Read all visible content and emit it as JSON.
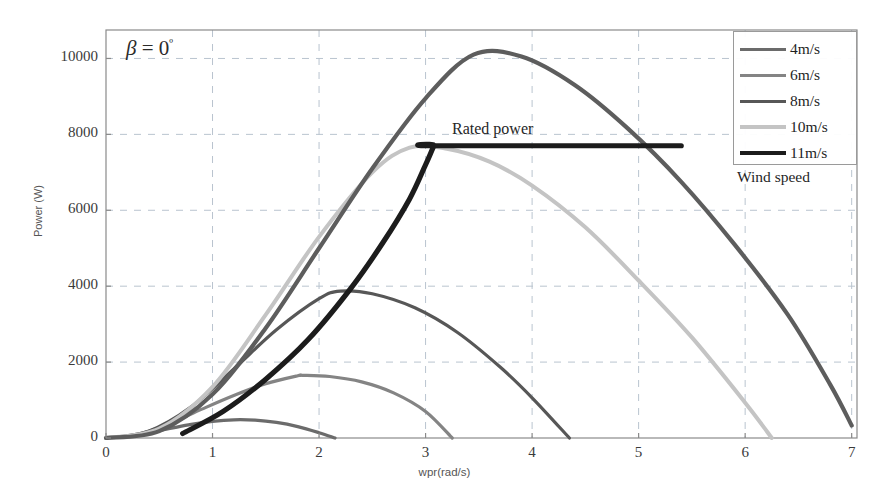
{
  "chart_data": {
    "type": "line",
    "title": "",
    "xlabel": "wpr(rad/s)",
    "ylabel": "Power (W)",
    "xlim": [
      0,
      7.05
    ],
    "ylim": [
      0,
      10750
    ],
    "xticks": [
      "0",
      "1",
      "2",
      "3",
      "4",
      "5",
      "6",
      "7"
    ],
    "xtick_values": [
      0,
      1,
      2,
      3,
      4,
      5,
      6,
      7
    ],
    "yticks": [
      "0",
      "2000",
      "4000",
      "6000",
      "8000",
      "10000"
    ],
    "ytick_values": [
      0,
      2000,
      4000,
      6000,
      8000,
      10000
    ],
    "grid": true,
    "grid_style": "dashed",
    "legend_position": "top-right",
    "legend_title": "Wind speed",
    "annotations": [
      {
        "name": "beta-annotation",
        "text_plain": "β = 0º",
        "beta": "β",
        "equals": " = 0",
        "degree": "º",
        "x": 0.2,
        "y": 10000
      },
      {
        "name": "rated-power-annotation",
        "text": "Rated power",
        "x": 3.3,
        "y": 8300
      }
    ],
    "series": [
      {
        "name": "4m/s",
        "label": "4m/s",
        "color": "#6b6b6b",
        "width": 3.2,
        "peak_x": 1.2,
        "peak_y": 480,
        "x_start": 0.0,
        "x_end": 2.15,
        "points": [
          [
            0,
            0
          ],
          [
            0.2,
            40
          ],
          [
            0.4,
            140
          ],
          [
            0.6,
            250
          ],
          [
            0.8,
            360
          ],
          [
            1.0,
            440
          ],
          [
            1.2,
            480
          ],
          [
            1.4,
            470
          ],
          [
            1.6,
            410
          ],
          [
            1.8,
            300
          ],
          [
            2.0,
            140
          ],
          [
            2.15,
            0
          ]
        ]
      },
      {
        "name": "6m/s",
        "label": "6m/s",
        "color": "#848484",
        "width": 3.2,
        "peak_x": 1.85,
        "peak_y": 1650,
        "x_start": 0.0,
        "x_end": 3.25,
        "points": [
          [
            0,
            0
          ],
          [
            0.3,
            100
          ],
          [
            0.6,
            380
          ],
          [
            0.9,
            760
          ],
          [
            1.2,
            1120
          ],
          [
            1.5,
            1430
          ],
          [
            1.8,
            1640
          ],
          [
            1.85,
            1650
          ],
          [
            2.1,
            1620
          ],
          [
            2.4,
            1480
          ],
          [
            2.7,
            1190
          ],
          [
            3.0,
            700
          ],
          [
            3.25,
            0
          ]
        ]
      },
      {
        "name": "8m/s",
        "label": "8m/s",
        "color": "#575757",
        "width": 3.2,
        "peak_x": 2.2,
        "peak_y": 3870,
        "x_start": 0.0,
        "x_end": 4.35,
        "points": [
          [
            0,
            0
          ],
          [
            0.4,
            180
          ],
          [
            0.8,
            820
          ],
          [
            1.2,
            1820
          ],
          [
            1.6,
            2850
          ],
          [
            2.0,
            3670
          ],
          [
            2.2,
            3870
          ],
          [
            2.5,
            3800
          ],
          [
            2.9,
            3430
          ],
          [
            3.3,
            2780
          ],
          [
            3.7,
            1870
          ],
          [
            4.0,
            1060
          ],
          [
            4.35,
            0
          ]
        ]
      },
      {
        "name": "10m/s",
        "label": "10m/s",
        "color": "#c4c4c4",
        "width": 4.0,
        "peak_x": 2.85,
        "peak_y": 7650,
        "x_start": 0.0,
        "x_end": 6.25,
        "points": [
          [
            0,
            0
          ],
          [
            0.5,
            250
          ],
          [
            1.0,
            1350
          ],
          [
            1.5,
            3250
          ],
          [
            2.0,
            5300
          ],
          [
            2.5,
            7000
          ],
          [
            2.85,
            7650
          ],
          [
            3.2,
            7620
          ],
          [
            3.6,
            7280
          ],
          [
            4.0,
            6650
          ],
          [
            4.5,
            5550
          ],
          [
            5.0,
            4150
          ],
          [
            5.5,
            2650
          ],
          [
            6.0,
            930
          ],
          [
            6.25,
            0
          ]
        ]
      },
      {
        "name": "11m/s",
        "label": "11m/s",
        "color": "#1c1c1c",
        "width": 5.2,
        "peak_y": 7700,
        "note": "power-limited to rated power plateau",
        "x_start": 0.72,
        "x_end": 5.4,
        "rated_power": 7700,
        "plateau_x_start": 3.1,
        "plateau_x_end": 5.4,
        "points": [
          [
            0.72,
            120
          ],
          [
            1.1,
            700
          ],
          [
            1.5,
            1550
          ],
          [
            1.9,
            2600
          ],
          [
            2.3,
            3950
          ],
          [
            2.6,
            5150
          ],
          [
            2.85,
            6300
          ],
          [
            3.0,
            7200
          ],
          [
            3.08,
            7700
          ],
          [
            3.1,
            7700
          ],
          [
            5.4,
            7700
          ]
        ]
      },
      {
        "name": "main-dark-curve",
        "label": "",
        "color": "#5d5d5d",
        "width": 4.2,
        "peak_x": 3.45,
        "peak_y": 10100,
        "x_start": 0.0,
        "x_end": 7.0,
        "points": [
          [
            0,
            0
          ],
          [
            0.5,
            180
          ],
          [
            1.0,
            1150
          ],
          [
            1.5,
            2900
          ],
          [
            2.0,
            5000
          ],
          [
            2.5,
            7100
          ],
          [
            3.0,
            8950
          ],
          [
            3.45,
            10100
          ],
          [
            3.9,
            10050
          ],
          [
            4.4,
            9300
          ],
          [
            4.9,
            8150
          ],
          [
            5.4,
            6750
          ],
          [
            5.9,
            5100
          ],
          [
            6.4,
            3250
          ],
          [
            6.8,
            1400
          ],
          [
            7.0,
            330
          ]
        ]
      }
    ]
  },
  "legend": {
    "title": "Wind speed",
    "items": [
      {
        "label": "4m/s",
        "color": "#6b6b6b",
        "width": 3.2
      },
      {
        "label": "6m/s",
        "color": "#848484",
        "width": 3.2
      },
      {
        "label": "8m/s",
        "color": "#575757",
        "width": 3.2
      },
      {
        "label": "10m/s",
        "color": "#c4c4c4",
        "width": 4.0
      },
      {
        "label": "11m/s",
        "color": "#1c1c1c",
        "width": 4.6
      }
    ]
  },
  "axes": {
    "frame_color": "#8a8a8a",
    "grid_color": "#b9c4cf",
    "tick_color": "#3a3a3a"
  }
}
